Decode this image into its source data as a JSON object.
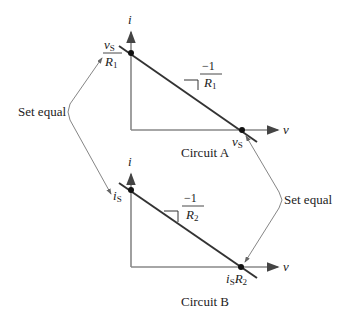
{
  "graph_a": {
    "y_axis_label": "i",
    "x_axis_label": "v",
    "y_intercept": {
      "num": "v",
      "num_sub": "S",
      "den": "R",
      "den_sub": "1"
    },
    "x_intercept": {
      "main": "v",
      "sub": "S"
    },
    "slope": {
      "num": "−1",
      "den": "R",
      "den_sub": "1"
    },
    "caption": "Circuit A"
  },
  "graph_b": {
    "y_axis_label": "i",
    "x_axis_label": "v",
    "y_intercept": {
      "main": "i",
      "sub": "S"
    },
    "x_intercept": {
      "main": "i",
      "sub": "S",
      "main2": "R",
      "sub2": "2"
    },
    "slope": {
      "num": "−1",
      "den": "R",
      "den_sub": "2"
    },
    "caption": "Circuit B"
  },
  "annotations": {
    "left": "Set equal",
    "right": "Set equal"
  },
  "colors": {
    "axis": "#888888",
    "line": "#333333",
    "dot": "#111111",
    "arrow": "#777777"
  }
}
